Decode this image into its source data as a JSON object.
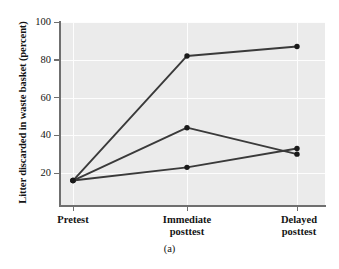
{
  "figure": {
    "caption": "(a)",
    "ylabel": "Litter discarded in waste basket (percent)"
  },
  "axes": {
    "y_ticks": [
      "20",
      "40",
      "60",
      "80",
      "100"
    ],
    "x_ticks": [
      {
        "line1": "Pretest",
        "line2": ""
      },
      {
        "line1": "Immediate",
        "line2": "posttest"
      },
      {
        "line1": "Delayed",
        "line2": "posttest"
      }
    ]
  },
  "style": {
    "plot_background": "#ebebeb",
    "gridline_color": "#fdfdfd",
    "axis_color": "#6f6f6f",
    "line_color": "#3a3a3a",
    "marker_color": "#1a1a1a"
  },
  "chart_data": {
    "type": "line",
    "title": "",
    "subtitle": "",
    "xlabel": "",
    "ylabel": "Litter discarded in waste basket (percent)",
    "caption": "(a)",
    "categories": [
      "Pretest",
      "Immediate posttest",
      "Delayed posttest"
    ],
    "series": [
      {
        "name": "Series 1",
        "values": [
          16,
          82,
          87
        ]
      },
      {
        "name": "Series 2",
        "values": [
          16,
          44,
          30
        ]
      },
      {
        "name": "Series 3",
        "values": [
          16,
          23,
          33
        ]
      }
    ],
    "ylim": [
      0,
      100
    ],
    "ytick_values": [
      20,
      40,
      60,
      80,
      100
    ],
    "grid": true,
    "grid_orientation": "both",
    "legend": "none",
    "markers": "filled-circle"
  }
}
